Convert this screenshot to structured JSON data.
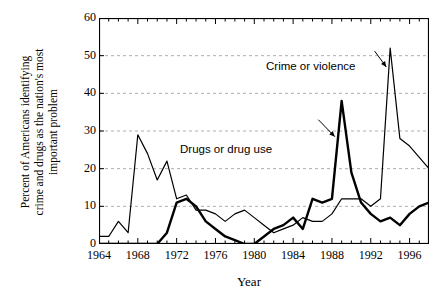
{
  "chart_data": {
    "type": "line",
    "title": "",
    "xlabel": "Year",
    "ylabel": "Percent of Americans identifying crime and drugs as the nation's most important problem",
    "ylabel_line1": "Percent of Americans identifying",
    "ylabel_line2": "crime and drugs as the nation's most",
    "ylabel_line3": "important problem",
    "xlim": [
      1964,
      1998
    ],
    "ylim": [
      0,
      60
    ],
    "yticks": [
      0,
      10,
      20,
      30,
      40,
      50,
      60
    ],
    "xticks_major": [
      1964,
      1968,
      1972,
      1976,
      1980,
      1984,
      1988,
      1992,
      1996
    ],
    "xtick_minor_step": 1,
    "grid": "horizontal-dashed",
    "legend": "annotations",
    "x": [
      1964,
      1965,
      1966,
      1967,
      1968,
      1969,
      1970,
      1971,
      1972,
      1973,
      1974,
      1975,
      1976,
      1977,
      1978,
      1979,
      1980,
      1981,
      1982,
      1983,
      1984,
      1985,
      1986,
      1987,
      1988,
      1989,
      1990,
      1991,
      1992,
      1993,
      1994,
      1995,
      1996,
      1997,
      1998
    ],
    "series": [
      {
        "name": "Crime or violence",
        "style": "thin",
        "color": "#000000",
        "values": [
          2,
          2,
          6,
          3,
          29,
          24,
          17,
          22,
          12,
          13,
          9,
          9,
          8,
          6,
          8,
          9,
          7,
          5,
          3,
          4,
          5,
          7,
          6,
          6,
          8,
          12,
          12,
          12,
          10,
          12,
          52,
          28,
          26,
          23,
          20
        ]
      },
      {
        "name": "Drugs or drug use",
        "style": "thick",
        "color": "#000000",
        "values": [
          0,
          0,
          0,
          0,
          0,
          0,
          0,
          3,
          11,
          12,
          10,
          6,
          4,
          2,
          1,
          0,
          0,
          2,
          4,
          5,
          7,
          4,
          12,
          11,
          12,
          38,
          19,
          11,
          8,
          6,
          7,
          5,
          8,
          10,
          11
        ]
      }
    ],
    "annotations": [
      {
        "text": "Crime or violence",
        "points_to_year": 1994,
        "points_to_value": 52
      },
      {
        "text": "Drugs or drug use",
        "points_to_year": 1989,
        "points_to_value": 38
      }
    ]
  }
}
